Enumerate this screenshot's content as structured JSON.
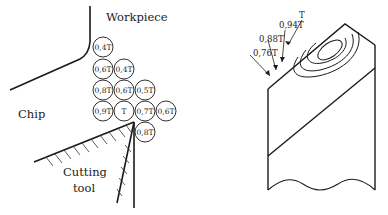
{
  "left_figure": {
    "labels": {
      "workpiece": "Workpiece",
      "chip": "Chip",
      "cutting_tool_line1": "Cutting",
      "cutting_tool_line2": "tool"
    },
    "temperature_circles": [
      {
        "label": "0,4T",
        "cx": 103,
        "cy": 47
      },
      {
        "label": "0,6T",
        "cx": 103,
        "cy": 69
      },
      {
        "label": "0,4T",
        "cx": 124,
        "cy": 69
      },
      {
        "label": "0,8T",
        "cx": 103,
        "cy": 90
      },
      {
        "label": "0,6T",
        "cx": 124,
        "cy": 90
      },
      {
        "label": "0,5T",
        "cx": 145,
        "cy": 90
      },
      {
        "label": "0,9T",
        "cx": 103,
        "cy": 111
      },
      {
        "label": "T",
        "cx": 124,
        "cy": 111
      },
      {
        "label": "0,7T",
        "cx": 145,
        "cy": 111
      },
      {
        "label": "0,6T",
        "cx": 166,
        "cy": 111
      },
      {
        "label": "0,8T",
        "cx": 145,
        "cy": 132
      }
    ]
  },
  "right_figure": {
    "isotherm_labels": [
      {
        "label": "T"
      },
      {
        "label": "0,94T"
      },
      {
        "label": "0,88T"
      },
      {
        "label": "0,76T"
      }
    ]
  },
  "colors": {
    "line": "#1a1a1a",
    "text": "#222222",
    "background": "#ffffff"
  }
}
